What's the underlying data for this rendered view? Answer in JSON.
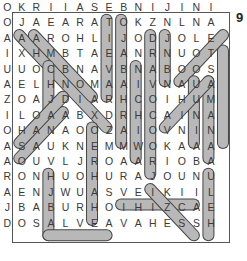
{
  "puzzle_number": "9",
  "grid": [
    "OKRIIASEBNIJINI",
    "OJAEARATOKZNLNA",
    "AAAROHLIJODJOLE",
    "IXHMBTAEANRNUOT",
    "UUOCBNAVBNABOOS",
    "AELHNOMAAIVNAUA",
    "ZOAJDIARHCOIHUM",
    "ILOAABXDRHCAINA",
    "OHANAOOZAIOVNIN",
    "ASAUKNEMMWOKAAA",
    "AOUVLJROAARIOBA",
    "RONHUOHURAJOUNU",
    "AENJWUASVEIKIIL",
    "JBABURHOIHIZCAE",
    "DOSALVEAVAHESSH"
  ],
  "highlights": [
    {
      "word": "SALAAM",
      "from": [
        6,
        0
      ],
      "to": [
        6,
        5
      ]
    },
    {
      "word": "ZDRAVEITE",
      "from": [
        7,
        0
      ],
      "to": [
        7,
        8
      ]
    },
    {
      "word": "KONNICHIWA",
      "from": [
        9,
        1
      ],
      "to": [
        9,
        10
      ]
    },
    {
      "word": "ZDRA",
      "from": [
        10,
        1
      ],
      "to": [
        10,
        4
      ]
    },
    {
      "word": "MARHABA",
      "from": [
        8,
        3
      ],
      "to": [
        8,
        9
      ]
    },
    {
      "word": "NAMASTE",
      "from": [
        14,
        2
      ],
      "to": [
        14,
        8
      ]
    },
    {
      "word": "OLA",
      "from": [
        14,
        1
      ],
      "to": [
        11,
        4
      ]
    },
    {
      "word": "NIHAO",
      "from": [
        12,
        4
      ],
      "to": [
        12,
        8
      ]
    },
    {
      "word": "COL13",
      "from": [
        13,
        4
      ],
      "to": [
        13,
        9
      ]
    },
    {
      "word": "CIAO",
      "from": [
        10,
        7
      ],
      "to": [
        13,
        4
      ]
    },
    {
      "word": "XINCHAO",
      "from": [
        0,
        1
      ],
      "to": [
        6,
        7
      ]
    },
    {
      "word": "JAMBO",
      "from": [
        1,
        1
      ],
      "to": [
        5,
        5
      ]
    },
    {
      "word": "HOLA",
      "from": [
        2,
        3
      ],
      "to": [
        2,
        6
      ]
    },
    {
      "word": "AHOJ",
      "from": [
        0,
        9
      ],
      "to": [
        3,
        6
      ]
    },
    {
      "word": "HALO",
      "from": [
        0,
        8
      ],
      "to": [
        3,
        5
      ]
    },
    {
      "word": "BONJOUR",
      "from": [
        5,
        7
      ],
      "to": [
        5,
        13
      ]
    },
    {
      "word": "SANNU",
      "from": [
        2,
        10
      ],
      "to": [
        2,
        14
      ]
    },
    {
      "word": "SALVE",
      "from": [
        2,
        14
      ],
      "to": [
        6,
        14
      ]
    },
    {
      "word": "SVEIKI",
      "from": [
        7,
        12
      ],
      "to": [
        12,
        12
      ]
    },
    {
      "word": "SZIA",
      "from": [
        9,
        11
      ],
      "to": [
        12,
        14
      ]
    },
    {
      "word": "COL13B",
      "from": [
        13,
        10
      ],
      "to": [
        13,
        14
      ]
    }
  ],
  "colors": {
    "highlight_fill": "#b8b8b8",
    "highlight_stroke": "#444444",
    "text": "#3a3a3a"
  }
}
